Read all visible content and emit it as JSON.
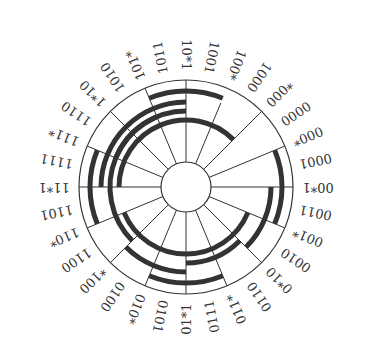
{
  "diagram": {
    "type": "circular-gray-code-wheel",
    "center": [
      186,
      187
    ],
    "radii": {
      "inner": 25,
      "outer": 107
    },
    "colors": {
      "line": "#333333",
      "arc": "#333333",
      "text": "#333333",
      "background": "#ffffff"
    },
    "labels": [
      {
        "text": "10*1",
        "angle": 0
      },
      {
        "text": "1001",
        "angle": 11.25
      },
      {
        "text": "100*",
        "angle": 22.5
      },
      {
        "text": "1000",
        "angle": 33.75
      },
      {
        "text": "*000",
        "angle": 45
      },
      {
        "text": "0000",
        "angle": 56.25
      },
      {
        "text": "000*",
        "angle": 67.5
      },
      {
        "text": "0001",
        "angle": 78.75
      },
      {
        "text": "00*1",
        "angle": 90
      },
      {
        "text": "0011",
        "angle": 101.25
      },
      {
        "text": "001*",
        "angle": 112.5
      },
      {
        "text": "0010",
        "angle": 123.75
      },
      {
        "text": "0*10",
        "angle": 135
      },
      {
        "text": "0110",
        "angle": 146.25
      },
      {
        "text": "011*",
        "angle": 157.5
      },
      {
        "text": "0111",
        "angle": 168.75
      },
      {
        "text": "01*1",
        "angle": 180
      },
      {
        "text": "0101",
        "angle": 191.25
      },
      {
        "text": "010*",
        "angle": 202.5
      },
      {
        "text": "0100",
        "angle": 213.75
      },
      {
        "text": "*100",
        "angle": 225
      },
      {
        "text": "1100",
        "angle": 236.25
      },
      {
        "text": "110*",
        "angle": 247.5
      },
      {
        "text": "1101",
        "angle": 258.75
      },
      {
        "text": "11*1",
        "angle": 270
      },
      {
        "text": "1111",
        "angle": 281.25
      },
      {
        "text": "111*",
        "angle": 292.5
      },
      {
        "text": "1110",
        "angle": 303.75
      },
      {
        "text": "1*10",
        "angle": 315
      },
      {
        "text": "1010",
        "angle": 326.25
      },
      {
        "text": "101*",
        "angle": 337.5
      },
      {
        "text": "1011",
        "angle": 348.75
      }
    ],
    "spokes": [
      {
        "angle": 0,
        "r1": 25,
        "r2": 107
      },
      {
        "angle": 22.5,
        "r1": 25,
        "r2": 91
      },
      {
        "angle": 45,
        "r1": 25,
        "r2": 107
      },
      {
        "angle": 67.5,
        "r1": 25,
        "r2": 107
      },
      {
        "angle": 90,
        "r1": 25,
        "r2": 107
      },
      {
        "angle": 112.5,
        "r1": 25,
        "r2": 107
      },
      {
        "angle": 135,
        "r1": 25,
        "r2": 107
      },
      {
        "angle": 157.5,
        "r1": 25,
        "r2": 107
      },
      {
        "angle": 180,
        "r1": 25,
        "r2": 107
      },
      {
        "angle": 202.5,
        "r1": 25,
        "r2": 107
      },
      {
        "angle": 225,
        "r1": 25,
        "r2": 107
      },
      {
        "angle": 247.5,
        "r1": 25,
        "r2": 107
      },
      {
        "angle": 270,
        "r1": 25,
        "r2": 107
      },
      {
        "angle": 292.5,
        "r1": 25,
        "r2": 107
      },
      {
        "angle": 315,
        "r1": 25,
        "r2": 107
      },
      {
        "angle": 337.5,
        "r1": 25,
        "r2": 107
      }
    ],
    "arcs": [
      {
        "r": 96,
        "start": -22.5,
        "end": 22.5
      },
      {
        "r": 85,
        "start": -45,
        "end": 0
      },
      {
        "r": 67,
        "start": -90,
        "end": 45
      },
      {
        "r": 76,
        "start": -67.5,
        "end": -22.5
      },
      {
        "r": 96,
        "start": 67.5,
        "end": 112.5
      },
      {
        "r": 85,
        "start": 90,
        "end": 135
      },
      {
        "r": 67,
        "start": 112.5,
        "end": 247.5
      },
      {
        "r": 76,
        "start": 135,
        "end": 180
      },
      {
        "r": 96,
        "start": 157.5,
        "end": 202.5
      },
      {
        "r": 85,
        "start": 180,
        "end": 225
      },
      {
        "r": 96,
        "start": 247.5,
        "end": 292.5
      },
      {
        "r": 85,
        "start": 270,
        "end": 315
      },
      {
        "r": 76,
        "start": 225,
        "end": 360
      }
    ]
  }
}
